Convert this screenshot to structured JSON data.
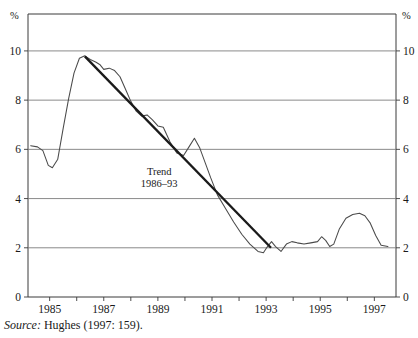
{
  "figure": {
    "source_prefix": "Source:",
    "source_text": "Hughes (1997: 159)."
  },
  "chart_data": {
    "type": "line",
    "title": "",
    "xlabel": "",
    "ylabel": "",
    "y_unit_label_left": "%",
    "y_unit_label_right": "%",
    "grid": true,
    "legend": "none",
    "xlim": [
      1984.2,
      1997.8
    ],
    "ylim": [
      0,
      11.5
    ],
    "y_ticks": [
      0,
      2,
      4,
      6,
      8,
      10
    ],
    "y_tick_labels": [
      "0",
      "2",
      "4",
      "6",
      "8",
      "10"
    ],
    "x_ticks": [
      1985,
      1986,
      1987,
      1988,
      1989,
      1990,
      1991,
      1992,
      1993,
      1994,
      1995,
      1996,
      1997
    ],
    "x_tick_labels": [
      "1985",
      "",
      "1987",
      "",
      "1989",
      "",
      "1991",
      "",
      "1993",
      "",
      "1995",
      "",
      "1997"
    ],
    "x_labeled_ticks": [
      1985,
      1987,
      1989,
      1991,
      1993,
      1995,
      1997
    ],
    "x_labeled_tick_labels": [
      "1985",
      "1987",
      "1989",
      "1991",
      "1993",
      "1995",
      "1997"
    ],
    "annotations": [
      {
        "name": "trend-annotation",
        "line1": "Trend",
        "line2": "1986–93",
        "x": 1989.05,
        "y": 4.95
      }
    ],
    "series": [
      {
        "name": "inflation-rate",
        "style": "thin",
        "x": [
          1984.3,
          1984.55,
          1984.75,
          1984.95,
          1985.1,
          1985.3,
          1985.5,
          1985.7,
          1985.9,
          1986.1,
          1986.3,
          1986.5,
          1986.7,
          1986.85,
          1987.0,
          1987.2,
          1987.4,
          1987.6,
          1987.8,
          1988.0,
          1988.2,
          1988.4,
          1988.6,
          1988.8,
          1989.0,
          1989.2,
          1989.45,
          1989.7,
          1989.95,
          1990.15,
          1990.35,
          1990.55,
          1990.75,
          1990.95,
          1991.2,
          1991.5,
          1991.8,
          1992.1,
          1992.4,
          1992.7,
          1992.9,
          1993.05,
          1993.2,
          1993.35,
          1993.55,
          1993.75,
          1993.95,
          1994.15,
          1994.4,
          1994.65,
          1994.9,
          1995.05,
          1995.2,
          1995.35,
          1995.5,
          1995.7,
          1995.95,
          1996.2,
          1996.45,
          1996.65,
          1996.85,
          1997.05,
          1997.25,
          1997.5
        ],
        "y": [
          6.15,
          6.1,
          5.95,
          5.35,
          5.25,
          5.6,
          6.85,
          8.05,
          9.1,
          9.7,
          9.8,
          9.65,
          9.55,
          9.45,
          9.25,
          9.3,
          9.2,
          8.95,
          8.45,
          7.95,
          7.55,
          7.35,
          7.4,
          7.2,
          6.95,
          6.9,
          6.3,
          5.85,
          5.75,
          6.1,
          6.45,
          6.05,
          5.45,
          4.85,
          4.15,
          3.6,
          3.05,
          2.55,
          2.15,
          1.85,
          1.8,
          2.05,
          2.25,
          2.05,
          1.85,
          2.15,
          2.25,
          2.2,
          2.15,
          2.2,
          2.25,
          2.45,
          2.3,
          2.05,
          2.15,
          2.75,
          3.2,
          3.35,
          3.4,
          3.3,
          3.0,
          2.5,
          2.1,
          2.05
        ]
      },
      {
        "name": "trend-1986-93",
        "style": "thick",
        "x": [
          1986.3,
          1993.18
        ],
        "y": [
          9.78,
          2.0
        ]
      }
    ]
  }
}
